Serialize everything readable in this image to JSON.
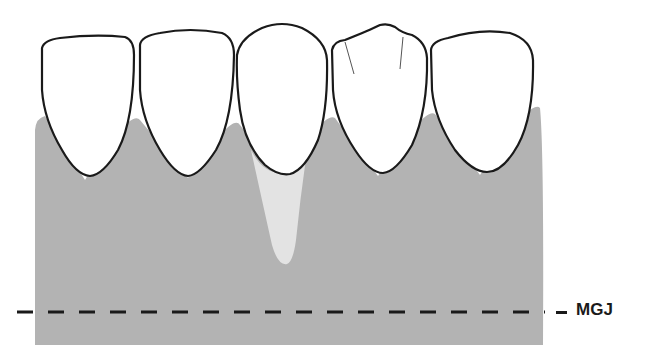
{
  "diagram": {
    "colors": {
      "gingiva": "#b3b3b3",
      "recession_area": "#e3e3e3",
      "tooth_fill": "#ffffff",
      "outline": "#1a1a1a",
      "background": "#ffffff"
    },
    "teeth_count": 5,
    "labels": {
      "mgj": "MGJ"
    }
  }
}
